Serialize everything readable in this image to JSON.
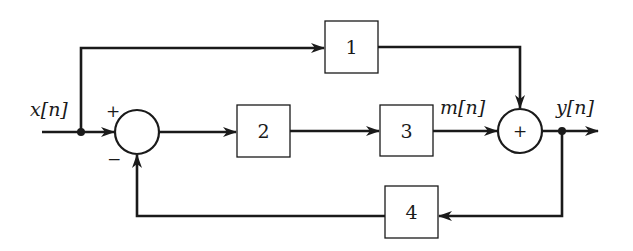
{
  "diagram": {
    "type": "block-diagram",
    "signals": {
      "input": "x[n]",
      "intermediate": "m[n]",
      "output": "y[n]"
    },
    "blocks": [
      {
        "id": "block-1",
        "label": "1"
      },
      {
        "id": "block-2",
        "label": "2"
      },
      {
        "id": "block-3",
        "label": "3"
      },
      {
        "id": "block-4",
        "label": "4"
      }
    ],
    "summers": [
      {
        "id": "summer-1",
        "center_label": "",
        "input_signs": {
          "left": "+",
          "bottom": "−"
        }
      },
      {
        "id": "summer-2",
        "center_label": "+"
      }
    ],
    "connections": [
      "x[n] → summer-1 (+)",
      "x[n] → block-1",
      "summer-1 → block-2",
      "block-2 → block-3",
      "block-3 → m[n] → summer-2",
      "block-1 → summer-2",
      "summer-2 → y[n]",
      "y[n] → block-4",
      "block-4 → summer-1 (−)"
    ],
    "colors": {
      "stroke": "#1a1a1a",
      "background": "#ffffff"
    }
  }
}
